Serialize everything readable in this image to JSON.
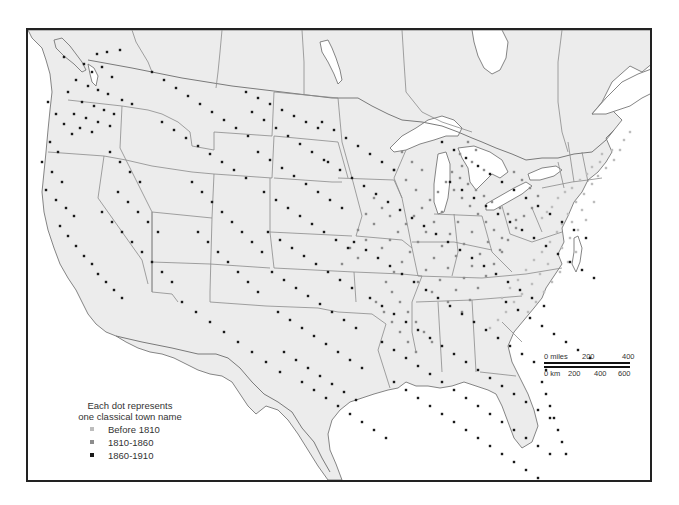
{
  "map": {
    "land_color": "#ececec",
    "water_color": "#ffffff",
    "border_color": "#8a8a8a",
    "frame_color": "#222222"
  },
  "legend": {
    "title_line1": "Each dot represents",
    "title_line2": "one classical town name",
    "items": [
      {
        "label": "Before 1810",
        "color": "#bdbdbd",
        "icon": "light-dot"
      },
      {
        "label": "1810-1860",
        "color": "#8c8c8c",
        "icon": "medium-dot"
      },
      {
        "label": "1860-1910",
        "color": "#1a1a1a",
        "icon": "dark-dot"
      }
    ]
  },
  "scale_bar": {
    "miles_label": "0 miles",
    "miles_ticks": [
      "200",
      "400"
    ],
    "km_label": "0 km",
    "km_ticks": [
      "200",
      "400",
      "600"
    ]
  },
  "dots": {
    "pre1810": [
      [
        628,
        130
      ],
      [
        622,
        138
      ],
      [
        610,
        148
      ],
      [
        600,
        152
      ],
      [
        598,
        160
      ],
      [
        590,
        165
      ],
      [
        585,
        172
      ],
      [
        578,
        178
      ],
      [
        570,
        186
      ],
      [
        563,
        190
      ],
      [
        556,
        196
      ],
      [
        550,
        205
      ],
      [
        545,
        210
      ],
      [
        540,
        216
      ],
      [
        560,
        222
      ],
      [
        566,
        212
      ],
      [
        574,
        200
      ],
      [
        582,
        192
      ],
      [
        590,
        182
      ],
      [
        596,
        174
      ],
      [
        604,
        166
      ],
      [
        612,
        158
      ],
      [
        618,
        148
      ],
      [
        592,
        200
      ],
      [
        580,
        208
      ],
      [
        570,
        220
      ],
      [
        555,
        230
      ],
      [
        548,
        240
      ],
      [
        540,
        250
      ],
      [
        532,
        258
      ],
      [
        524,
        268
      ],
      [
        516,
        278
      ],
      [
        508,
        286
      ],
      [
        500,
        296
      ],
      [
        560,
        246
      ],
      [
        568,
        236
      ],
      [
        576,
        228
      ],
      [
        584,
        218
      ],
      [
        546,
        262
      ],
      [
        538,
        272
      ],
      [
        530,
        282
      ],
      [
        520,
        292
      ],
      [
        512,
        300
      ],
      [
        504,
        310
      ],
      [
        496,
        318
      ],
      [
        488,
        326
      ],
      [
        542,
        290
      ],
      [
        534,
        300
      ],
      [
        526,
        310
      ],
      [
        550,
        280
      ],
      [
        558,
        270
      ],
      [
        566,
        260
      ],
      [
        574,
        250
      ]
    ],
    "mid1810_1860": [
      [
        450,
        170
      ],
      [
        458,
        176
      ],
      [
        466,
        182
      ],
      [
        474,
        188
      ],
      [
        482,
        194
      ],
      [
        490,
        200
      ],
      [
        498,
        206
      ],
      [
        506,
        212
      ],
      [
        514,
        218
      ],
      [
        444,
        180
      ],
      [
        452,
        188
      ],
      [
        460,
        196
      ],
      [
        468,
        204
      ],
      [
        476,
        212
      ],
      [
        484,
        220
      ],
      [
        492,
        228
      ],
      [
        500,
        236
      ],
      [
        436,
        190
      ],
      [
        428,
        198
      ],
      [
        420,
        206
      ],
      [
        412,
        214
      ],
      [
        404,
        222
      ],
      [
        396,
        230
      ],
      [
        388,
        238
      ],
      [
        380,
        246
      ],
      [
        440,
        210
      ],
      [
        432,
        220
      ],
      [
        424,
        230
      ],
      [
        416,
        240
      ],
      [
        408,
        250
      ],
      [
        400,
        260
      ],
      [
        392,
        270
      ],
      [
        384,
        280
      ],
      [
        456,
        220
      ],
      [
        448,
        232
      ],
      [
        440,
        244
      ],
      [
        432,
        256
      ],
      [
        424,
        268
      ],
      [
        416,
        280
      ],
      [
        470,
        230
      ],
      [
        462,
        242
      ],
      [
        454,
        254
      ],
      [
        446,
        266
      ],
      [
        438,
        278
      ],
      [
        430,
        290
      ],
      [
        486,
        240
      ],
      [
        478,
        252
      ],
      [
        470,
        264
      ],
      [
        462,
        276
      ],
      [
        454,
        288
      ],
      [
        446,
        300
      ],
      [
        500,
        250
      ],
      [
        492,
        262
      ],
      [
        484,
        274
      ],
      [
        476,
        286
      ],
      [
        468,
        298
      ],
      [
        460,
        310
      ],
      [
        512,
        170
      ],
      [
        520,
        178
      ],
      [
        528,
        186
      ],
      [
        536,
        194
      ],
      [
        530,
        206
      ],
      [
        522,
        214
      ],
      [
        514,
        226
      ],
      [
        506,
        238
      ],
      [
        498,
        248
      ],
      [
        466,
        140
      ],
      [
        474,
        148
      ],
      [
        458,
        152
      ],
      [
        470,
        160
      ],
      [
        482,
        168
      ],
      [
        460,
        164
      ],
      [
        400,
        150
      ],
      [
        410,
        160
      ],
      [
        420,
        168
      ],
      [
        392,
        168
      ],
      [
        404,
        178
      ],
      [
        414,
        188
      ],
      [
        372,
        196
      ],
      [
        380,
        206
      ],
      [
        388,
        214
      ],
      [
        364,
        212
      ],
      [
        372,
        222
      ],
      [
        356,
        228
      ],
      [
        364,
        238
      ],
      [
        348,
        246
      ],
      [
        356,
        256
      ],
      [
        340,
        262
      ],
      [
        390,
        290
      ],
      [
        398,
        300
      ],
      [
        406,
        310
      ],
      [
        414,
        320
      ],
      [
        422,
        330
      ],
      [
        430,
        340
      ],
      [
        374,
        300
      ],
      [
        382,
        310
      ],
      [
        390,
        320
      ],
      [
        398,
        330
      ],
      [
        406,
        340
      ],
      [
        414,
        350
      ]
    ],
    "late1860_1910": [
      [
        62,
        55
      ],
      [
        95,
        52
      ],
      [
        105,
        50
      ],
      [
        118,
        48
      ],
      [
        82,
        62
      ],
      [
        90,
        70
      ],
      [
        100,
        65
      ],
      [
        110,
        75
      ],
      [
        74,
        78
      ],
      [
        86,
        84
      ],
      [
        96,
        88
      ],
      [
        106,
        92
      ],
      [
        66,
        90
      ],
      [
        120,
        98
      ],
      [
        130,
        102
      ],
      [
        80,
        100
      ],
      [
        92,
        104
      ],
      [
        102,
        108
      ],
      [
        112,
        112
      ],
      [
        72,
        112
      ],
      [
        84,
        116
      ],
      [
        96,
        120
      ],
      [
        108,
        124
      ],
      [
        78,
        126
      ],
      [
        90,
        130
      ],
      [
        46,
        100
      ],
      [
        54,
        112
      ],
      [
        62,
        122
      ],
      [
        70,
        132
      ],
      [
        48,
        140
      ],
      [
        56,
        150
      ],
      [
        40,
        160
      ],
      [
        50,
        170
      ],
      [
        60,
        180
      ],
      [
        44,
        188
      ],
      [
        54,
        198
      ],
      [
        64,
        206
      ],
      [
        72,
        214
      ],
      [
        58,
        224
      ],
      [
        66,
        234
      ],
      [
        74,
        244
      ],
      [
        82,
        254
      ],
      [
        90,
        262
      ],
      [
        96,
        272
      ],
      [
        104,
        280
      ],
      [
        112,
        288
      ],
      [
        120,
        296
      ],
      [
        108,
        150
      ],
      [
        118,
        160
      ],
      [
        128,
        170
      ],
      [
        138,
        180
      ],
      [
        116,
        190
      ],
      [
        126,
        200
      ],
      [
        136,
        210
      ],
      [
        146,
        220
      ],
      [
        156,
        230
      ],
      [
        100,
        210
      ],
      [
        110,
        220
      ],
      [
        120,
        230
      ],
      [
        130,
        240
      ],
      [
        140,
        250
      ],
      [
        150,
        260
      ],
      [
        160,
        270
      ],
      [
        170,
        280
      ],
      [
        150,
        70
      ],
      [
        162,
        78
      ],
      [
        174,
        86
      ],
      [
        186,
        94
      ],
      [
        198,
        102
      ],
      [
        210,
        110
      ],
      [
        222,
        118
      ],
      [
        234,
        126
      ],
      [
        246,
        134
      ],
      [
        160,
        120
      ],
      [
        172,
        128
      ],
      [
        184,
        136
      ],
      [
        196,
        144
      ],
      [
        208,
        152
      ],
      [
        220,
        160
      ],
      [
        232,
        168
      ],
      [
        244,
        176
      ],
      [
        190,
        180
      ],
      [
        200,
        190
      ],
      [
        210,
        200
      ],
      [
        220,
        210
      ],
      [
        230,
        220
      ],
      [
        240,
        230
      ],
      [
        250,
        240
      ],
      [
        260,
        250
      ],
      [
        196,
        230
      ],
      [
        206,
        240
      ],
      [
        216,
        250
      ],
      [
        226,
        260
      ],
      [
        236,
        270
      ],
      [
        246,
        280
      ],
      [
        256,
        290
      ],
      [
        180,
        300
      ],
      [
        194,
        310
      ],
      [
        208,
        320
      ],
      [
        222,
        330
      ],
      [
        236,
        340
      ],
      [
        250,
        350
      ],
      [
        264,
        360
      ],
      [
        278,
        370
      ],
      [
        244,
        90
      ],
      [
        256,
        96
      ],
      [
        268,
        102
      ],
      [
        280,
        108
      ],
      [
        292,
        114
      ],
      [
        304,
        120
      ],
      [
        316,
        126
      ],
      [
        250,
        110
      ],
      [
        262,
        118
      ],
      [
        274,
        126
      ],
      [
        286,
        134
      ],
      [
        298,
        142
      ],
      [
        310,
        150
      ],
      [
        322,
        158
      ],
      [
        256,
        150
      ],
      [
        268,
        158
      ],
      [
        280,
        166
      ],
      [
        292,
        174
      ],
      [
        304,
        182
      ],
      [
        316,
        190
      ],
      [
        328,
        198
      ],
      [
        340,
        206
      ],
      [
        262,
        190
      ],
      [
        274,
        198
      ],
      [
        286,
        206
      ],
      [
        298,
        214
      ],
      [
        310,
        222
      ],
      [
        322,
        230
      ],
      [
        334,
        238
      ],
      [
        346,
        246
      ],
      [
        266,
        230
      ],
      [
        278,
        238
      ],
      [
        290,
        246
      ],
      [
        302,
        254
      ],
      [
        314,
        262
      ],
      [
        326,
        270
      ],
      [
        338,
        278
      ],
      [
        350,
        286
      ],
      [
        270,
        270
      ],
      [
        282,
        278
      ],
      [
        294,
        286
      ],
      [
        306,
        294
      ],
      [
        318,
        302
      ],
      [
        330,
        310
      ],
      [
        342,
        318
      ],
      [
        354,
        326
      ],
      [
        276,
        310
      ],
      [
        288,
        318
      ],
      [
        300,
        326
      ],
      [
        312,
        334
      ],
      [
        324,
        342
      ],
      [
        336,
        350
      ],
      [
        348,
        358
      ],
      [
        360,
        366
      ],
      [
        282,
        350
      ],
      [
        294,
        358
      ],
      [
        306,
        366
      ],
      [
        318,
        374
      ],
      [
        330,
        382
      ],
      [
        342,
        390
      ],
      [
        354,
        398
      ],
      [
        300,
        380
      ],
      [
        312,
        388
      ],
      [
        324,
        396
      ],
      [
        336,
        404
      ],
      [
        348,
        412
      ],
      [
        360,
        420
      ],
      [
        372,
        428
      ],
      [
        384,
        436
      ],
      [
        320,
        120
      ],
      [
        332,
        128
      ],
      [
        344,
        136
      ],
      [
        356,
        144
      ],
      [
        368,
        152
      ],
      [
        380,
        160
      ],
      [
        392,
        168
      ],
      [
        326,
        160
      ],
      [
        338,
        168
      ],
      [
        350,
        176
      ],
      [
        362,
        184
      ],
      [
        374,
        192
      ],
      [
        386,
        200
      ],
      [
        398,
        208
      ],
      [
        410,
        216
      ],
      [
        422,
        224
      ],
      [
        434,
        232
      ],
      [
        446,
        240
      ],
      [
        458,
        248
      ],
      [
        470,
        256
      ],
      [
        482,
        264
      ],
      [
        494,
        272
      ],
      [
        506,
        280
      ],
      [
        518,
        288
      ],
      [
        530,
        296
      ],
      [
        542,
        304
      ],
      [
        352,
        240
      ],
      [
        364,
        248
      ],
      [
        376,
        256
      ],
      [
        388,
        264
      ],
      [
        400,
        272
      ],
      [
        412,
        280
      ],
      [
        424,
        288
      ],
      [
        436,
        296
      ],
      [
        448,
        304
      ],
      [
        460,
        312
      ],
      [
        472,
        320
      ],
      [
        484,
        328
      ],
      [
        496,
        336
      ],
      [
        508,
        344
      ],
      [
        520,
        352
      ],
      [
        532,
        360
      ],
      [
        544,
        368
      ],
      [
        368,
        296
      ],
      [
        380,
        304
      ],
      [
        392,
        312
      ],
      [
        404,
        320
      ],
      [
        416,
        328
      ],
      [
        428,
        336
      ],
      [
        440,
        344
      ],
      [
        452,
        352
      ],
      [
        464,
        360
      ],
      [
        476,
        368
      ],
      [
        488,
        376
      ],
      [
        500,
        384
      ],
      [
        512,
        392
      ],
      [
        524,
        400
      ],
      [
        536,
        408
      ],
      [
        548,
        416
      ],
      [
        380,
        340
      ],
      [
        392,
        348
      ],
      [
        404,
        356
      ],
      [
        416,
        364
      ],
      [
        428,
        372
      ],
      [
        440,
        380
      ],
      [
        452,
        388
      ],
      [
        464,
        396
      ],
      [
        476,
        404
      ],
      [
        488,
        412
      ],
      [
        500,
        420
      ],
      [
        512,
        428
      ],
      [
        524,
        436
      ],
      [
        536,
        444
      ],
      [
        548,
        452
      ],
      [
        392,
        380
      ],
      [
        404,
        388
      ],
      [
        416,
        396
      ],
      [
        428,
        404
      ],
      [
        440,
        412
      ],
      [
        452,
        420
      ],
      [
        464,
        428
      ],
      [
        476,
        436
      ],
      [
        488,
        444
      ],
      [
        500,
        452
      ],
      [
        512,
        460
      ],
      [
        524,
        468
      ],
      [
        536,
        476
      ],
      [
        440,
        140
      ],
      [
        452,
        148
      ],
      [
        464,
        156
      ],
      [
        476,
        164
      ],
      [
        488,
        172
      ],
      [
        500,
        180
      ],
      [
        512,
        188
      ],
      [
        524,
        196
      ],
      [
        536,
        204
      ],
      [
        548,
        212
      ],
      [
        560,
        220
      ],
      [
        572,
        228
      ],
      [
        584,
        236
      ],
      [
        448,
        180
      ],
      [
        460,
        188
      ],
      [
        472,
        196
      ],
      [
        484,
        204
      ],
      [
        496,
        212
      ],
      [
        508,
        220
      ],
      [
        520,
        228
      ],
      [
        532,
        236
      ],
      [
        544,
        244
      ],
      [
        556,
        252
      ],
      [
        568,
        260
      ],
      [
        580,
        268
      ],
      [
        592,
        276
      ],
      [
        504,
        300
      ],
      [
        516,
        308
      ],
      [
        528,
        316
      ],
      [
        540,
        324
      ],
      [
        552,
        332
      ],
      [
        564,
        340
      ],
      [
        576,
        348
      ],
      [
        588,
        356
      ],
      [
        540,
        380
      ],
      [
        544,
        392
      ],
      [
        548,
        404
      ],
      [
        552,
        416
      ],
      [
        556,
        428
      ],
      [
        560,
        440
      ],
      [
        564,
        452
      ]
    ]
  }
}
